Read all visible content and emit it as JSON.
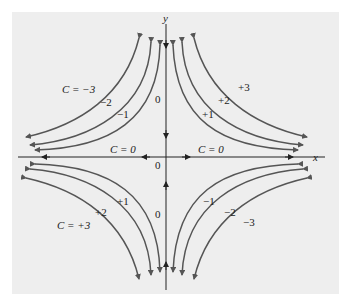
{
  "figure": {
    "axes": {
      "x_label": "x",
      "y_label": "y"
    },
    "curve_family": "xy = C",
    "labels": {
      "q2": {
        "c_minus3": "C = −3",
        "c_minus2": "−2",
        "c_minus1": "−1",
        "c_zero": "0"
      },
      "q1": {
        "c_plus3": "+3",
        "c_plus2": "+2",
        "c_plus1": "+1"
      },
      "q3": {
        "c_plus3": "C = +3",
        "c_plus2": "+2",
        "c_plus1": "+1",
        "c_zero": "0"
      },
      "q4": {
        "c_minus1": "−1",
        "c_minus2": "−2",
        "c_minus3": "−3"
      },
      "axis_left": "C = 0",
      "axis_right": "C = 0",
      "origin_zero": "0"
    },
    "colors": {
      "background": "#eeeeee",
      "curve": "#555555",
      "axis": "#222222"
    }
  }
}
